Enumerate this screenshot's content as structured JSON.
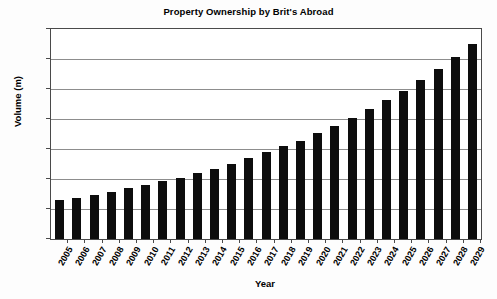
{
  "chart_data": {
    "type": "bar",
    "title": "Property Ownership by Brit's Abroad",
    "xlabel": "Year",
    "ylabel": "Volume (m)",
    "ylim": [
      0,
      14
    ],
    "ytick_step": 2,
    "yticks": [
      "14",
      "12",
      "10",
      "8",
      "6",
      "4",
      "2",
      "0"
    ],
    "grid": true,
    "legend": "none",
    "bar_color": "#0d0d0d",
    "categories": [
      "2005",
      "2006",
      "2007",
      "2008",
      "2009",
      "2010",
      "2011",
      "2012",
      "2013",
      "2014",
      "2015",
      "2016",
      "2017",
      "2018",
      "2019",
      "2020",
      "2021",
      "2022",
      "2023",
      "2024",
      "2025",
      "2026",
      "2027",
      "2028",
      "2029"
    ],
    "values": [
      2.6,
      2.75,
      2.95,
      3.15,
      3.4,
      3.6,
      3.85,
      4.1,
      4.4,
      4.7,
      5.0,
      5.4,
      5.8,
      6.2,
      6.55,
      7.1,
      7.55,
      8.1,
      8.65,
      9.3,
      9.9,
      10.6,
      11.35,
      12.15,
      13.0
    ]
  }
}
